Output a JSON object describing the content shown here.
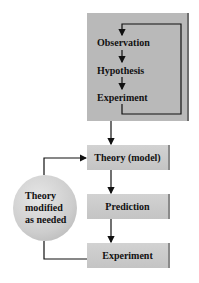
{
  "diagram": {
    "type": "flowchart",
    "top_loop": {
      "steps": [
        "Observation",
        "Hypothesis",
        "Experiment"
      ]
    },
    "main_flow": {
      "boxes": [
        "Theory (model)",
        "Prediction",
        "Experiment"
      ]
    },
    "feedback": {
      "label_lines": [
        "Theory",
        "modified",
        "as needed"
      ]
    },
    "colors": {
      "top_box": "#b9b9b9",
      "box": "#cbcbcb",
      "circle": "#d2d2d2",
      "line": "#111111"
    }
  }
}
